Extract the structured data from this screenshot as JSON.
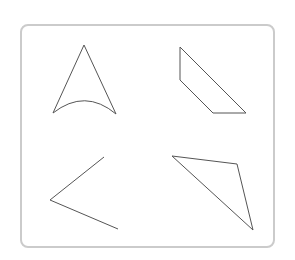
{
  "diagram": {
    "title": "Geometric shapes",
    "frame": {
      "border_color": "#cbcbcb",
      "stroke_color": "#555555"
    },
    "shapes": [
      {
        "name": "curved-triangle",
        "description": "Triangle with curved (concave) base",
        "points": [
          [
            84,
            45
          ],
          [
            53,
            113
          ],
          [
            116,
            114
          ]
        ],
        "arc_control": [
          85,
          88
        ]
      },
      {
        "name": "trapezoid",
        "description": "Quadrilateral with two parallel sides",
        "points": [
          [
            180,
            47
          ],
          [
            180,
            80
          ],
          [
            213,
            113
          ],
          [
            246,
            113
          ]
        ]
      },
      {
        "name": "angle",
        "description": "Two rays meeting at a vertex",
        "points": [
          [
            104,
            157
          ],
          [
            50,
            200
          ],
          [
            118,
            229
          ]
        ]
      },
      {
        "name": "scalene-triangle",
        "description": "Obtuse/scalene triangle",
        "points": [
          [
            172,
            156
          ],
          [
            237,
            164
          ],
          [
            253,
            230
          ]
        ]
      }
    ]
  }
}
